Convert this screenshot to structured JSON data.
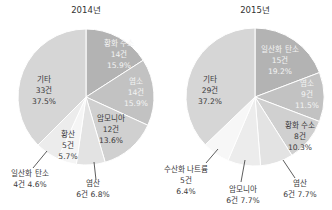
{
  "chart_data": [
    {
      "type": "pie",
      "title": "2014년",
      "center": [
        86,
        97
      ],
      "radius": 68,
      "start_angle_deg": 0,
      "slices": [
        {
          "label": "황화 수소",
          "count": "14건",
          "percent": "15.9%",
          "value": 14,
          "color": "#b3b3b3",
          "text": "light",
          "label_pos": [
            119,
            46
          ]
        },
        {
          "label": "염소",
          "count": "14건",
          "percent": "15.9%",
          "value": 14,
          "color": "#c2c2c2",
          "text": "light",
          "label_pos": [
            136,
            84
          ]
        },
        {
          "label": "암모니아",
          "count": "12건",
          "percent": "13.6%",
          "value": 12,
          "color": "#d0d0d0",
          "text": "dark",
          "label_pos": [
            111,
            121
          ]
        },
        {
          "label": "염산",
          "count": "6건",
          "percent": "6.8%",
          "value": 6,
          "color": "#e3e3e3",
          "text": "dark",
          "label_pos": [
            93,
            186
          ],
          "leader": [
            [
              94,
              162
            ],
            [
              96,
              180
            ]
          ],
          "inline": true
        },
        {
          "label": "일산화 탄소",
          "count": "4건",
          "percent": "4.6%",
          "value": 4,
          "color": "#f5f5f5",
          "text": "dark",
          "label_pos": [
            30,
            176
          ],
          "leader": [
            [
              47,
              151
            ],
            [
              33,
              168
            ]
          ],
          "inline": true
        },
        {
          "label": "황산",
          "count": "5건",
          "percent": "5.7%",
          "value": 5,
          "color": "#ececec",
          "text": "dark",
          "label_pos": [
            68,
            137
          ]
        },
        {
          "label": "기타",
          "count": "33건",
          "percent": "37.5%",
          "value": 33,
          "color": "#d6d6d6",
          "text": "dark",
          "label_pos": [
            44,
            82
          ]
        }
      ]
    },
    {
      "type": "pie",
      "title": "2015년",
      "center": [
        255,
        97
      ],
      "radius": 69,
      "start_angle_deg": 0,
      "slices": [
        {
          "label": "일산화 탄소",
          "count": "15건",
          "percent": "19.2%",
          "value": 15,
          "color": "#b3b3b3",
          "text": "light",
          "label_pos": [
            280,
            52
          ]
        },
        {
          "label": "염소",
          "count": "9건",
          "percent": "11.5%",
          "value": 9,
          "color": "#c2c2c2",
          "text": "light",
          "label_pos": [
            307,
            86
          ]
        },
        {
          "label": "황화 수소",
          "count": "8건",
          "percent": "10.3%",
          "value": 8,
          "color": "#d0d0d0",
          "text": "dark",
          "label_pos": [
            300,
            128
          ]
        },
        {
          "label": "염산",
          "count": "6건",
          "percent": "7.7%",
          "value": 6,
          "color": "#e3e3e3",
          "text": "dark",
          "label_pos": [
            300,
            186
          ],
          "leader": [
            [
              283,
              160
            ],
            [
              295,
              178
            ]
          ],
          "inline": true
        },
        {
          "label": "암모니아",
          "count": "6건",
          "percent": "7.7%",
          "value": 6,
          "color": "#ececec",
          "text": "dark",
          "label_pos": [
            243,
            192
          ],
          "leader": [
            [
              245,
              160
            ],
            [
              241,
              182
            ]
          ],
          "inline": true
        },
        {
          "label": "수산화 나트륨",
          "count": "5건",
          "percent": "6.4%",
          "value": 5,
          "color": "#f7f7f7",
          "text": "dark",
          "label_pos": [
            186,
            172
          ],
          "leader": [
            [
              218,
              149
            ],
            [
              206,
              163
            ]
          ]
        },
        {
          "label": "기타",
          "count": "29건",
          "percent": "37.2%",
          "value": 29,
          "color": "#d6d6d6",
          "text": "dark",
          "label_pos": [
            210,
            82
          ]
        }
      ]
    }
  ]
}
